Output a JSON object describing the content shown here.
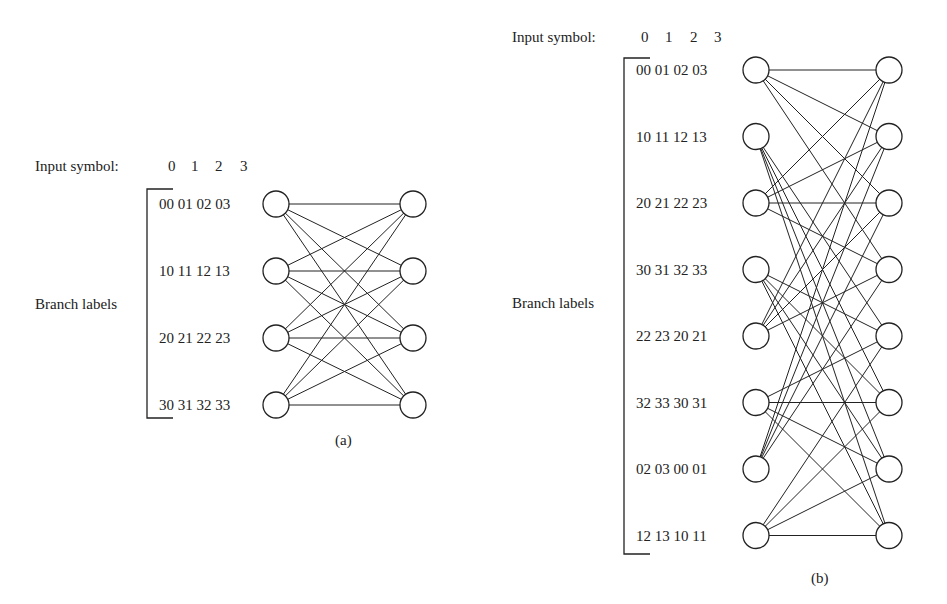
{
  "diagram_a": {
    "input_label": "Input symbol:",
    "input_symbols": [
      "0",
      "1",
      "2",
      "3"
    ],
    "branch_labels_title": "Branch labels",
    "rows": [
      "00 01 02 03",
      "10 11 12 13",
      "20 21 22 23",
      "30 31 32 33"
    ],
    "caption": "(a)",
    "states": 4,
    "edges": [
      [
        0,
        0
      ],
      [
        0,
        1
      ],
      [
        0,
        2
      ],
      [
        0,
        3
      ],
      [
        1,
        0
      ],
      [
        1,
        1
      ],
      [
        1,
        2
      ],
      [
        1,
        3
      ],
      [
        2,
        0
      ],
      [
        2,
        1
      ],
      [
        2,
        2
      ],
      [
        2,
        3
      ],
      [
        3,
        0
      ],
      [
        3,
        1
      ],
      [
        3,
        2
      ],
      [
        3,
        3
      ]
    ]
  },
  "diagram_b": {
    "input_label": "Input symbol:",
    "input_symbols": [
      "0",
      "1",
      "2",
      "3"
    ],
    "branch_labels_title": "Branch labels",
    "rows": [
      "00 01 02 03",
      "10 11 12 13",
      "20 21 22 23",
      "30 31 32 33",
      "22 23 20 21",
      "32 33 30 31",
      "02 03 00 01",
      "12 13 10 11"
    ],
    "caption": "(b)",
    "states": 8,
    "edges": [
      [
        0,
        0
      ],
      [
        0,
        1
      ],
      [
        0,
        2
      ],
      [
        0,
        3
      ],
      [
        1,
        4
      ],
      [
        1,
        5
      ],
      [
        1,
        6
      ],
      [
        1,
        7
      ],
      [
        2,
        0
      ],
      [
        2,
        1
      ],
      [
        2,
        2
      ],
      [
        2,
        3
      ],
      [
        3,
        4
      ],
      [
        3,
        5
      ],
      [
        3,
        6
      ],
      [
        3,
        7
      ],
      [
        4,
        0
      ],
      [
        4,
        1
      ],
      [
        4,
        2
      ],
      [
        4,
        3
      ],
      [
        5,
        4
      ],
      [
        5,
        5
      ],
      [
        5,
        6
      ],
      [
        5,
        7
      ],
      [
        6,
        0
      ],
      [
        6,
        1
      ],
      [
        6,
        2
      ],
      [
        6,
        3
      ],
      [
        7,
        4
      ],
      [
        7,
        5
      ],
      [
        7,
        6
      ],
      [
        7,
        7
      ]
    ]
  }
}
